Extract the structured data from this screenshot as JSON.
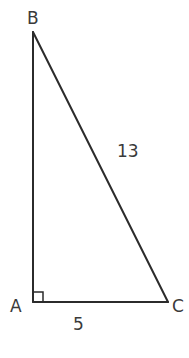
{
  "diagram": {
    "type": "right-triangle",
    "vertices": [
      {
        "label": "A",
        "x": 33,
        "y": 302,
        "right_angle": true
      },
      {
        "label": "B",
        "x": 33,
        "y": 32
      },
      {
        "label": "C",
        "x": 168,
        "y": 302
      }
    ],
    "sides": [
      {
        "from": "A",
        "to": "C",
        "label": "5"
      },
      {
        "from": "B",
        "to": "C",
        "label": "13"
      },
      {
        "from": "A",
        "to": "B",
        "label": ""
      }
    ],
    "labels": {
      "vertex_a": "A",
      "vertex_b": "B",
      "vertex_c": "C",
      "side_ac": "5",
      "side_bc": "13"
    },
    "colors": {
      "line": "#2b2b2b",
      "text": "#3a3a3a",
      "background": "#ffffff"
    }
  }
}
